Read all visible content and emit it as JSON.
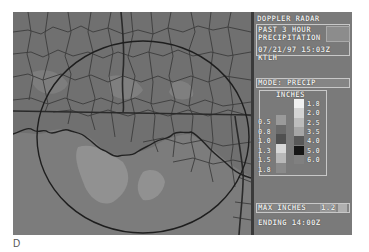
{
  "panel": {
    "title": "DOPPLER RADAR",
    "product_line1": "PAST 3 HOUR",
    "product_line2": "PRECIPITATION",
    "datetime": "07/21/97 15:03Z",
    "station": "KTLH",
    "mode_label": "MODE:",
    "mode_value": "PRECIP",
    "legend_units": "INCHES",
    "legend_left": [
      {
        "label": "0.5",
        "color": "#9a9a9a"
      },
      {
        "label": "0.8",
        "color": "#6a6a6a"
      },
      {
        "label": "1.0",
        "color": "#505050"
      },
      {
        "label": "1.3",
        "color": "#d8d8d8"
      },
      {
        "label": "1.5",
        "color": "#b8b8b8"
      },
      {
        "label": "1.8",
        "color": "#8a8a8a"
      }
    ],
    "legend_right": [
      {
        "label": "1.8",
        "color": "#f0f0f0"
      },
      {
        "label": "2.0",
        "color": "#d4d4d4"
      },
      {
        "label": "2.5",
        "color": "#bcbcbc"
      },
      {
        "label": "3.5",
        "color": "#a6a6a6"
      },
      {
        "label": "4.0",
        "color": "#585858"
      },
      {
        "label": "5.0",
        "color": "#151515"
      },
      {
        "label": "6.0",
        "color": "#808080"
      }
    ],
    "max_label": "MAX INCHES",
    "max_value": "1.2",
    "ending": "ENDING 14:00Z"
  },
  "map": {
    "subject": "Florida Panhandle / Southern Georgia and Alabama county map",
    "range_ring": "radar range circle centered on KTLH"
  },
  "caption": "D"
}
